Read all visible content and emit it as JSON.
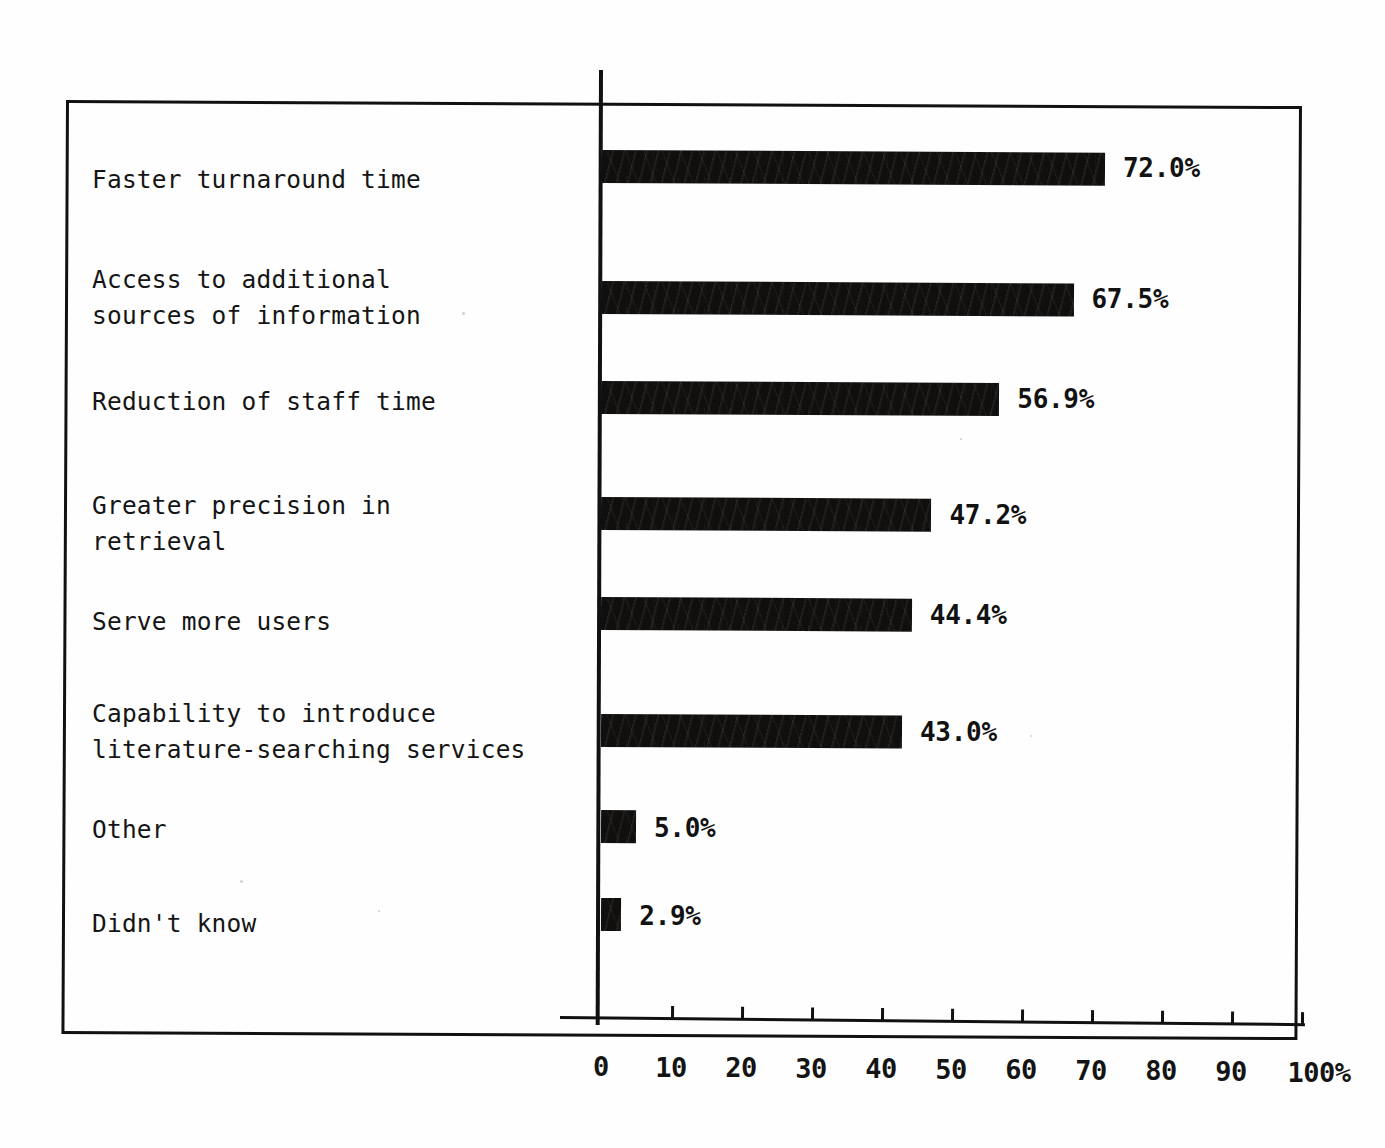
{
  "chart_data": {
    "type": "bar",
    "orientation": "horizontal",
    "title": "",
    "xlabel": "",
    "ylabel": "",
    "xlim": [
      0,
      100
    ],
    "grid": false,
    "legend": null,
    "bar_color": "#100f0d",
    "categories": [
      "Faster turnaround time",
      "Access to additional\nsources of information",
      "Reduction of staff time",
      "Greater precision in\nretrieval",
      "Serve more users",
      "Capability to introduce\nliterature-searching services",
      "Other",
      "Didn't know"
    ],
    "values": [
      72.0,
      67.5,
      56.9,
      47.2,
      44.4,
      43.0,
      5.0,
      2.9
    ],
    "value_labels": [
      "72.0%",
      "67.5%",
      "56.9%",
      "47.2%",
      "44.4%",
      "43.0%",
      "5.0%",
      "2.9%"
    ],
    "xticks": [
      0,
      10,
      20,
      30,
      40,
      50,
      60,
      70,
      80,
      90,
      100
    ],
    "xticklabels": [
      "0",
      "10",
      "20",
      "30",
      "40",
      "50",
      "60",
      "70",
      "80",
      "90",
      "100%"
    ]
  }
}
